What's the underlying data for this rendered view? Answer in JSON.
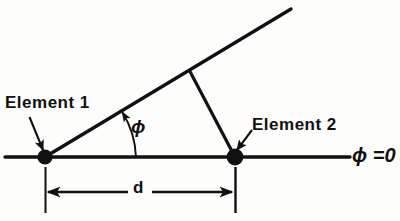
{
  "figure": {
    "type": "geometry-diagram",
    "labels": {
      "element1": "Element 1",
      "element2": "Element 2",
      "phi_zero": "ϕ =0",
      "phi": "ϕ",
      "spacing": "d"
    },
    "colors": {
      "ink": "#111111",
      "background": "#fdfdfb"
    },
    "geometry": {
      "element1_point": {
        "x": 45,
        "y": 157
      },
      "element2_point": {
        "x": 235,
        "y": 157
      },
      "axis_line": {
        "x1": 5,
        "y1": 157,
        "x2": 350,
        "y2": 157
      },
      "ray": {
        "x1": 45,
        "y1": 157,
        "x2": 291,
        "y2": 9
      },
      "perpendicular": {
        "x1": 190,
        "y1": 72,
        "x2": 235,
        "y2": 157
      },
      "angle_arc": {
        "cx": 45,
        "cy": 157,
        "radius": 92,
        "start_deg": 0,
        "end_deg": 31
      },
      "dimension_line": {
        "x1": 45,
        "y1": 192,
        "x2": 235,
        "y2": 192
      },
      "extension_line_left": {
        "x": 45,
        "y1": 168,
        "y2": 213
      },
      "extension_line_right": {
        "x": 235,
        "y1": 168,
        "y2": 213
      }
    }
  }
}
